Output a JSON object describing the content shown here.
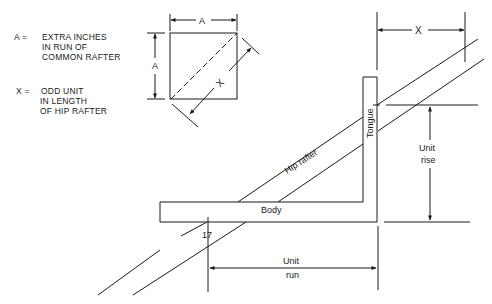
{
  "legend": {
    "items": [
      {
        "symbol": "A =",
        "lines": [
          "EXTRA INCHES",
          "IN RUN OF",
          "COMMON RAFTER"
        ]
      },
      {
        "symbol": "X =",
        "lines": [
          "ODD UNIT",
          "IN LENGTH",
          "OF HIP RAFTER"
        ]
      }
    ]
  },
  "inset": {
    "top_dimension": "A",
    "left_dimension": "A",
    "diagonal_dimension": "X"
  },
  "square": {
    "body_label": "Body",
    "tongue_label": "Tongue",
    "body_mark": "17"
  },
  "rafter": {
    "label": "Hip rafter"
  },
  "dimensions": {
    "x_label": "X",
    "unit_rise_line1": "Unit",
    "unit_rise_line2": "rise",
    "unit_run_line1": "Unit",
    "unit_run_line2": "run"
  },
  "colors": {
    "ink": "#1a1a1a",
    "background": "#ffffff"
  }
}
